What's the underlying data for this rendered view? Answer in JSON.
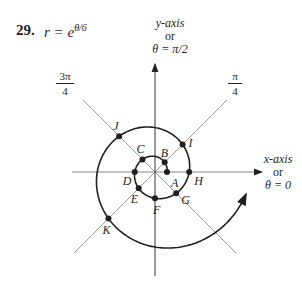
{
  "problem": {
    "number": "29.",
    "equation_lhs": "r = e",
    "equation_exp": "θ/6"
  },
  "axes": {
    "y_label": [
      "y-axis",
      "or",
      "θ = π/2"
    ],
    "x_label": [
      "x-axis",
      "or",
      "θ = 0"
    ],
    "diag_pi4": {
      "num": "π",
      "den": "4"
    },
    "diag_3pi4": {
      "num": "3π",
      "den": "4"
    }
  },
  "chart_data": {
    "type": "polar-curve",
    "curve": "logarithmic spiral r = e^(θ/6), starting at θ = 0",
    "points": [
      {
        "label": "A",
        "theta": "0",
        "r": 1.0
      },
      {
        "label": "B",
        "theta": "π/4",
        "r": 1.14
      },
      {
        "label": "C",
        "theta": "3π/4",
        "r": 1.48
      },
      {
        "label": "D",
        "theta": "π",
        "r": 1.69
      },
      {
        "label": "E",
        "theta": "5π/4",
        "r": 1.92
      },
      {
        "label": "F",
        "theta": "3π/2",
        "r": 2.19
      },
      {
        "label": "G",
        "theta": "7π/4",
        "r": 2.5
      },
      {
        "label": "H",
        "theta": "2π",
        "r": 2.85
      },
      {
        "label": "I",
        "theta": "9π/4",
        "r": 3.25
      },
      {
        "label": "J",
        "theta": "11π/4",
        "r": 4.22
      },
      {
        "label": "K",
        "theta": "13π/4",
        "r": 5.49
      }
    ],
    "reference_lines": [
      "θ = 0",
      "θ = π/4",
      "θ = π/2",
      "θ = 3π/4"
    ]
  }
}
